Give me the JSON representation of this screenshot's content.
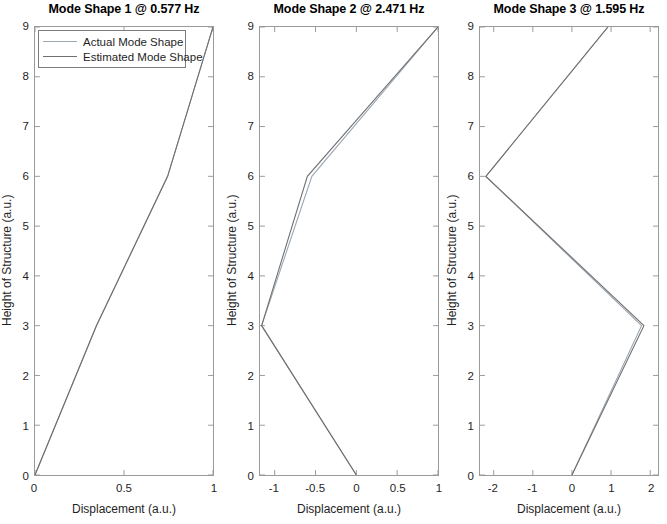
{
  "figure": {
    "width": 667,
    "height": 524,
    "background": "#ffffff"
  },
  "legend": {
    "entries": [
      {
        "label": "Actual Mode Shape",
        "color": "#9aa6b2"
      },
      {
        "label": "Estimated Mode Shape",
        "color": "#6f6f6f"
      }
    ]
  },
  "axis_common": {
    "ylabel": "Height of Structure (a.u.)",
    "xlabel": "Displacement (a.u.)",
    "yticks": [
      0,
      1,
      2,
      3,
      4,
      5,
      6,
      7,
      8,
      9
    ],
    "ylim": [
      0,
      9
    ]
  },
  "chart_data": [
    {
      "type": "line",
      "title": "Mode Shape 1 @ 0.577 Hz",
      "xlabel": "Displacement (a.u.)",
      "ylabel": "Height of Structure (a.u.)",
      "xlim": [
        0,
        1
      ],
      "ylim": [
        0,
        9
      ],
      "xticks": [
        0,
        0.5,
        1
      ],
      "xticklabels": [
        "0",
        "0.5",
        "1"
      ],
      "yticks": [
        0,
        1,
        2,
        3,
        4,
        5,
        6,
        7,
        8,
        9
      ],
      "grid": false,
      "legend_position": "upper-left",
      "series": [
        {
          "name": "Actual Mode Shape",
          "color": "#9aa6b2",
          "y": [
            0,
            3,
            6,
            9
          ],
          "values": [
            0,
            0.345,
            0.745,
            1.0
          ]
        },
        {
          "name": "Estimated Mode Shape",
          "color": "#6f6f6f",
          "y": [
            0,
            3,
            6,
            9
          ],
          "values": [
            0,
            0.345,
            0.745,
            1.0
          ]
        }
      ]
    },
    {
      "type": "line",
      "title": "Mode Shape 2 @ 2.471 Hz",
      "xlabel": "Displacement (a.u.)",
      "ylabel": "Height of Structure (a.u.)",
      "xlim": [
        -1.18,
        1.0
      ],
      "ylim": [
        0,
        9
      ],
      "xticks": [
        -1,
        -0.5,
        0,
        0.5,
        1
      ],
      "xticklabels": [
        "-1",
        "-0.5",
        "0",
        "0.5",
        "1"
      ],
      "yticks": [
        0,
        1,
        2,
        3,
        4,
        5,
        6,
        7,
        8,
        9
      ],
      "grid": false,
      "legend_position": "none",
      "series": [
        {
          "name": "Actual Mode Shape",
          "color": "#9aa6b2",
          "y": [
            0,
            3,
            6,
            9
          ],
          "values": [
            0,
            -1.16,
            -0.545,
            1.0
          ]
        },
        {
          "name": "Estimated Mode Shape",
          "color": "#6f6f6f",
          "y": [
            0,
            3,
            6,
            9
          ],
          "values": [
            0,
            -1.16,
            -0.6,
            1.0
          ]
        }
      ]
    },
    {
      "type": "line",
      "title": "Mode Shape 3 @ 1.595 Hz",
      "xlabel": "Displacement (a.u.)",
      "ylabel": "Height of Structure (a.u.)",
      "xlim": [
        -2.35,
        2.2
      ],
      "ylim": [
        0,
        9
      ],
      "xticks": [
        -2,
        -1,
        0,
        1,
        2
      ],
      "xticklabels": [
        "-2",
        "-1",
        "0",
        "1",
        "2"
      ],
      "yticks": [
        0,
        1,
        2,
        3,
        4,
        5,
        6,
        7,
        8,
        9
      ],
      "grid": false,
      "legend_position": "none",
      "series": [
        {
          "name": "Actual Mode Shape",
          "color": "#9aa6b2",
          "y": [
            0,
            3,
            6,
            9
          ],
          "values": [
            0,
            1.78,
            -2.2,
            0.92
          ]
        },
        {
          "name": "Estimated Mode Shape",
          "color": "#6f6f6f",
          "y": [
            0,
            3,
            6,
            9
          ],
          "values": [
            0,
            1.84,
            -2.2,
            0.92
          ]
        }
      ]
    }
  ]
}
